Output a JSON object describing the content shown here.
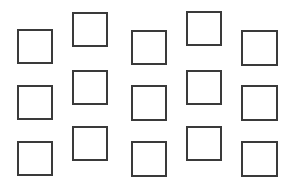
{
  "figure": {
    "title": "",
    "type": "square-grid-pattern",
    "canvas": {
      "width": 299,
      "height": 188
    },
    "background_color": "#ffffff",
    "square_outline_color": "#3a3a3a",
    "square_fill_color": "transparent",
    "square_border_width_px": 2,
    "rows": 3,
    "columns": 5,
    "arrangement_note": "Odd columns sit lower, even columns sit higher (staggered zigzag)",
    "squares": [
      {
        "id": "r1c1",
        "row": 1,
        "col": 1,
        "x": 17,
        "y": 29,
        "w": 36,
        "h": 35
      },
      {
        "id": "r1c2",
        "row": 1,
        "col": 2,
        "x": 72,
        "y": 12,
        "w": 36,
        "h": 35
      },
      {
        "id": "r1c3",
        "row": 1,
        "col": 3,
        "x": 131,
        "y": 30,
        "w": 36,
        "h": 35
      },
      {
        "id": "r1c4",
        "row": 1,
        "col": 4,
        "x": 186,
        "y": 11,
        "w": 36,
        "h": 35
      },
      {
        "id": "r1c5",
        "row": 1,
        "col": 5,
        "x": 241,
        "y": 30,
        "w": 37,
        "h": 36
      },
      {
        "id": "r2c1",
        "row": 2,
        "col": 1,
        "x": 17,
        "y": 85,
        "w": 36,
        "h": 35
      },
      {
        "id": "r2c2",
        "row": 2,
        "col": 2,
        "x": 72,
        "y": 70,
        "w": 36,
        "h": 35
      },
      {
        "id": "r2c3",
        "row": 2,
        "col": 3,
        "x": 131,
        "y": 85,
        "w": 36,
        "h": 36
      },
      {
        "id": "r2c4",
        "row": 2,
        "col": 4,
        "x": 186,
        "y": 70,
        "w": 36,
        "h": 35
      },
      {
        "id": "r2c5",
        "row": 2,
        "col": 5,
        "x": 241,
        "y": 85,
        "w": 37,
        "h": 36
      },
      {
        "id": "r3c1",
        "row": 3,
        "col": 1,
        "x": 17,
        "y": 141,
        "w": 36,
        "h": 35
      },
      {
        "id": "r3c2",
        "row": 3,
        "col": 2,
        "x": 72,
        "y": 126,
        "w": 36,
        "h": 35
      },
      {
        "id": "r3c3",
        "row": 3,
        "col": 3,
        "x": 131,
        "y": 141,
        "w": 36,
        "h": 36
      },
      {
        "id": "r3c4",
        "row": 3,
        "col": 4,
        "x": 186,
        "y": 126,
        "w": 36,
        "h": 35
      },
      {
        "id": "r3c5",
        "row": 3,
        "col": 5,
        "x": 241,
        "y": 141,
        "w": 37,
        "h": 36
      }
    ]
  }
}
